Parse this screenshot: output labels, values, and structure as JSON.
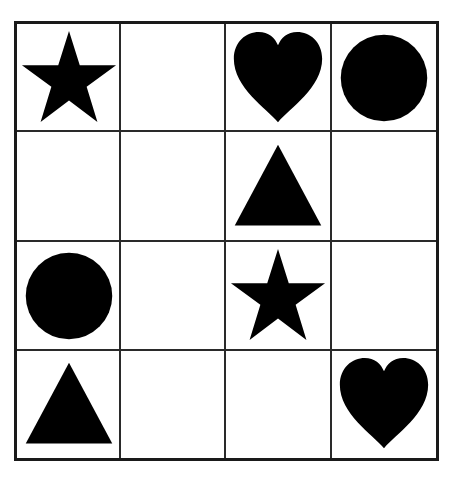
{
  "puzzle": {
    "rows": 4,
    "cols": 4,
    "fill_color": "#000000",
    "line_color": "#2a2a2a",
    "grid": [
      [
        "star",
        "",
        "heart",
        "circle"
      ],
      [
        "",
        "",
        "triangle",
        ""
      ],
      [
        "circle",
        "",
        "star",
        ""
      ],
      [
        "triangle",
        "",
        "",
        "heart"
      ]
    ]
  }
}
